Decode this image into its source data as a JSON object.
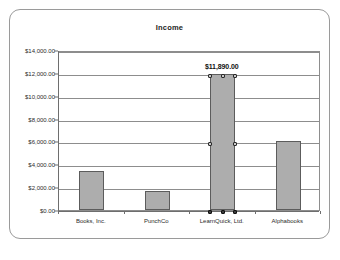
{
  "chart_data": {
    "type": "bar",
    "title": "Income",
    "xlabel": "",
    "ylabel": "",
    "categories": [
      "Books, Inc.",
      "PunchCo",
      "LearnQuick, Ltd.",
      "Alphabooks"
    ],
    "values": [
      3400,
      1650,
      11890,
      6000
    ],
    "value_labels": [
      "",
      "",
      "$11,890.00",
      ""
    ],
    "ylim": [
      0,
      14000
    ],
    "ytick_values": [
      0,
      2000,
      4000,
      6000,
      8000,
      10000,
      12000,
      14000
    ],
    "ytick_labels": [
      "$0.00",
      "$2,000.00",
      "$4,000.00",
      "$6,000.00",
      "$8,000.00",
      "$10,000.00",
      "$12,000.00",
      "$14,000.00"
    ],
    "grid": true,
    "legend": false,
    "legend_position": "none",
    "series": [
      {
        "name": "Income",
        "values": [
          3400,
          1650,
          11890,
          6000
        ],
        "bar_color": "#adadad",
        "bar_border_color": "#5c5c5c",
        "selected": true
      }
    ],
    "annotations": [
      {
        "text": "$11,890.00",
        "category": "LearnQuick, Ltd.",
        "value": 11890
      }
    ]
  },
  "chart": {
    "title": "Income",
    "selected_series_label": "Income"
  },
  "caption": {
    "text": ""
  },
  "colors": {
    "bar_fill": "#adadad",
    "bar_border": "#5c5c5c",
    "gridline": "#8d8d8d",
    "axis": "#6e6e6e",
    "frame_border": "#9a9a9a",
    "text": "#2b2b2b",
    "label_text": "#111111",
    "handle_fill": "#3a3a3a",
    "background": "#ffffff"
  }
}
